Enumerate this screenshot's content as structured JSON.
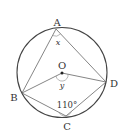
{
  "diagram": {
    "type": "inscribed-quadrilateral-circle",
    "colors": {
      "line": "#555555",
      "circle": "#444444",
      "text": "#333333"
    },
    "points": {
      "A": {
        "label": "A"
      },
      "B": {
        "label": "B"
      },
      "C": {
        "label": "C"
      },
      "D": {
        "label": "D"
      },
      "O": {
        "label": "O"
      }
    },
    "angles": {
      "x": "x",
      "y": "y",
      "c": "110°"
    }
  }
}
